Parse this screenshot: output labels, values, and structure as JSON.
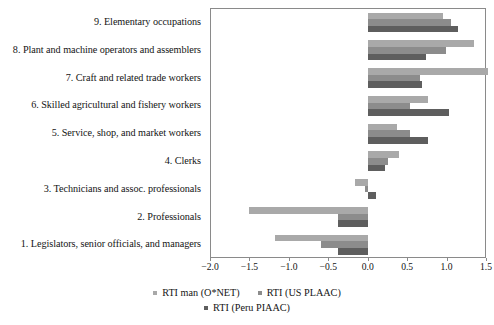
{
  "chart_data": {
    "type": "bar",
    "orientation": "horizontal",
    "title": "",
    "subtitle": "",
    "xlabel": "",
    "ylabel": "",
    "xlim": [
      -2.0,
      1.5
    ],
    "ylim": null,
    "grid": false,
    "legend_position": "bottom",
    "xticks": [
      -2.0,
      -1.5,
      -1.0,
      -0.5,
      0.0,
      0.5,
      1.0,
      1.5
    ],
    "xtick_labels": [
      "−2.0",
      "−1.5",
      "−1.0",
      "−0.5",
      "0.0",
      "0.5",
      "1.0",
      "1.5"
    ],
    "categories": [
      "9. Elementary occupations",
      "8. Plant and machine operators and assemblers",
      "7. Craft and related trade workers",
      "6. Skilled agricultural and fishery workers",
      "5. Service, shop, and market workers",
      "4. Clerks",
      "3. Technicians and assoc. professionals",
      "2. Professionals",
      "1. Legislators, senior officials, and managers"
    ],
    "series": [
      {
        "name": "RTI man (O*NET)",
        "color": "#a9a9a9",
        "values": [
          0.95,
          1.35,
          1.53,
          0.76,
          0.37,
          0.4,
          -0.16,
          -1.5,
          -1.18
        ]
      },
      {
        "name": "RTI (US PLAAC)",
        "color": "#8c8c8c",
        "values": [
          1.05,
          0.99,
          0.66,
          0.54,
          0.54,
          0.26,
          -0.04,
          -0.38,
          -0.59
        ]
      },
      {
        "name": "RTI (Peru PIAAC)",
        "color": "#5e5e5e",
        "values": [
          1.15,
          0.74,
          0.69,
          1.03,
          0.76,
          0.22,
          0.1,
          -0.38,
          -0.38
        ]
      }
    ]
  },
  "legend": {
    "rows": [
      [
        "RTI man (O*NET)",
        "RTI (US PLAAC)"
      ],
      [
        "RTI (Peru PIAAC)"
      ]
    ]
  },
  "colors": {
    "series_1": "#a9a9a9",
    "series_2": "#8c8c8c",
    "series_3": "#5e5e5e",
    "axis": "#8a8a8a",
    "text": "#141414",
    "background": "#ffffff"
  }
}
